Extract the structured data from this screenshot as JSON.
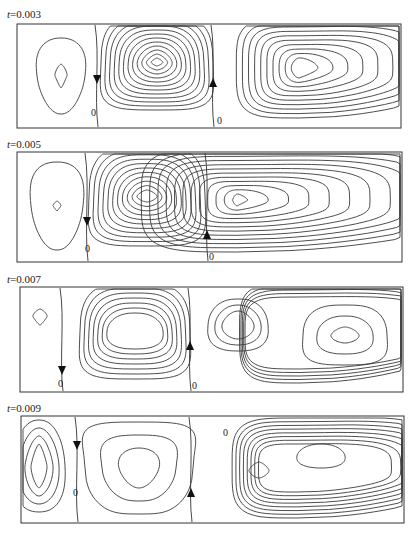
{
  "figure": {
    "panels": [
      {
        "label_prefix": "t",
        "label_value": "=0.003",
        "label_top": 8,
        "box": {
          "x": 17,
          "y": 24,
          "w": 384,
          "h": 104
        },
        "zero_lines": [
          {
            "x": 80,
            "label": "0",
            "label_dx": -6,
            "label_y": 92,
            "arrow": "down",
            "arrow_y": 56
          },
          {
            "x": 196,
            "label": "0",
            "label_dx": 4,
            "label_y": 100,
            "arrow": "up",
            "arrow_y": 58
          }
        ],
        "cells": [
          {
            "name": "left-cell",
            "cx": 44,
            "cy": 52,
            "rx0": 6,
            "ry0": 12,
            "rx1": 24,
            "ry1": 38,
            "n": 2,
            "shape": "tri"
          },
          {
            "name": "middle-cell",
            "cx": 140,
            "cy": 38,
            "rx0": 6,
            "ry0": 4,
            "rx1": 56,
            "ry1": 48,
            "n": 12,
            "shape": "egg"
          },
          {
            "name": "right-cell",
            "cx": 282,
            "cy": 44,
            "rx0": 14,
            "ry0": 10,
            "rx1": 114,
            "ry1": 50,
            "n": 10,
            "shape": "tail"
          }
        ]
      },
      {
        "label_prefix": "t",
        "label_value": "=0.005",
        "label_top": 138,
        "box": {
          "x": 17,
          "y": 152,
          "w": 385,
          "h": 110
        },
        "zero_lines": [
          {
            "x": 70,
            "label": "0",
            "label_dx": -2,
            "label_y": 100,
            "arrow": "down",
            "arrow_y": 70
          },
          {
            "x": 190,
            "label": "0",
            "label_dx": 2,
            "label_y": 108,
            "arrow": "up",
            "arrow_y": 82
          }
        ],
        "cells": [
          {
            "name": "left-cell",
            "cx": 40,
            "cy": 54,
            "rx0": 4,
            "ry0": 5,
            "rx1": 26,
            "ry1": 44,
            "n": 2,
            "shape": "tri"
          },
          {
            "name": "middle-cell",
            "cx": 130,
            "cy": 44,
            "rx0": 10,
            "ry0": 6,
            "rx1": 58,
            "ry1": 50,
            "n": 11,
            "shape": "egg"
          },
          {
            "name": "right-cell",
            "cx": 220,
            "cy": 48,
            "rx0": 8,
            "ry0": 6,
            "rx1": 174,
            "ry1": 52,
            "n": 12,
            "shape": "tail"
          }
        ]
      },
      {
        "label_prefix": "t",
        "label_value": "=0.007",
        "label_top": 273,
        "box": {
          "x": 20,
          "y": 287,
          "w": 383,
          "h": 105
        },
        "zero_lines": [
          {
            "x": 42,
            "label": "0",
            "label_dx": -4,
            "label_y": 100,
            "arrow": "down",
            "arrow_y": 84
          },
          {
            "x": 170,
            "label": "0",
            "label_dx": 2,
            "label_y": 102,
            "arrow": "up",
            "arrow_y": 58
          }
        ],
        "cells": [
          {
            "name": "left-cell",
            "cx": 20,
            "cy": 30,
            "rx0": 7,
            "ry0": 8,
            "rx1": 7,
            "ry1": 8,
            "n": 1,
            "shape": "tri"
          },
          {
            "name": "middle-cell",
            "cx": 115,
            "cy": 44,
            "rx0": 28,
            "ry0": 18,
            "rx1": 55,
            "ry1": 48,
            "n": 7,
            "shape": "egg"
          },
          {
            "name": "right-cell-left-eddy",
            "cx": 218,
            "cy": 38,
            "rx0": 16,
            "ry0": 14,
            "rx1": 30,
            "ry1": 26,
            "n": 3,
            "shape": "egg"
          },
          {
            "name": "right-cell-right-eddy",
            "cx": 325,
            "cy": 48,
            "rx0": 14,
            "ry0": 8,
            "rx1": 42,
            "ry1": 30,
            "n": 3,
            "shape": "egg"
          },
          {
            "name": "right-cell-outer",
            "cx": 280,
            "cy": 46,
            "rx0": 100,
            "ry0": 36,
            "rx1": 110,
            "ry1": 50,
            "n": 5,
            "shape": "tail"
          }
        ]
      },
      {
        "label_prefix": "t",
        "label_value": "=0.009",
        "label_top": 402,
        "box": {
          "x": 21,
          "y": 416,
          "w": 383,
          "h": 107
        },
        "zero_lines": [
          {
            "x": 56,
            "label": "0",
            "label_dx": -4,
            "label_y": 80,
            "arrow": "down",
            "arrow_y": 30
          },
          {
            "x": 170,
            "label": "0",
            "label_dx": 32,
            "label_y": 20,
            "arrow": "up",
            "arrow_y": 76
          }
        ],
        "cells": [
          {
            "name": "left-cell",
            "cx": 18,
            "cy": 50,
            "rx0": 8,
            "ry0": 22,
            "rx1": 26,
            "ry1": 46,
            "n": 4,
            "shape": "egg"
          },
          {
            "name": "middle-cell",
            "cx": 118,
            "cy": 52,
            "rx0": 20,
            "ry0": 20,
            "rx1": 54,
            "ry1": 46,
            "n": 3,
            "shape": "tri"
          },
          {
            "name": "right-cell-left-eddy",
            "cx": 238,
            "cy": 54,
            "rx0": 10,
            "ry0": 8,
            "rx1": 10,
            "ry1": 8,
            "n": 1,
            "shape": "egg"
          },
          {
            "name": "right-cell-right-eddy",
            "cx": 300,
            "cy": 40,
            "rx0": 24,
            "ry0": 12,
            "rx1": 24,
            "ry1": 12,
            "n": 1,
            "shape": "egg"
          },
          {
            "name": "right-cell-outer",
            "cx": 276,
            "cy": 52,
            "rx0": 70,
            "ry0": 24,
            "rx1": 118,
            "ry1": 50,
            "n": 8,
            "shape": "tail"
          }
        ]
      }
    ]
  }
}
